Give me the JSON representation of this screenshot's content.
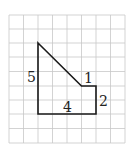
{
  "diagram": {
    "type": "grid-polygon",
    "grid": {
      "cols": 8,
      "rows": 9,
      "line_color": "#c8c8c8"
    },
    "shape_color": "#1a1a1a",
    "labels": {
      "left": "5",
      "bottom": "4",
      "right": "2",
      "top_step": "1"
    }
  }
}
